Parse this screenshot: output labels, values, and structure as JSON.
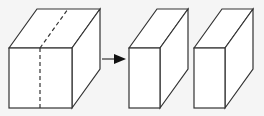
{
  "diagram": {
    "background": "#f5f5f5",
    "stroke_color": "#333333",
    "stroke_width": 1.2,
    "original_cube": {
      "front_face": {
        "x1": 9,
        "y1": 48,
        "x2": 72,
        "y2": 108
      },
      "back_offset": {
        "dx": 28,
        "dy": -39
      },
      "cut_line": {
        "front_x": 40,
        "style": "dashed"
      }
    },
    "arrow": {
      "x1": 102,
      "x2": 126,
      "y": 59,
      "direction": "right"
    },
    "result_blocks": [
      {
        "front_face": {
          "x1": 129,
          "y1": 48,
          "x2": 160,
          "y2": 108
        },
        "back_offset": {
          "dx": 28,
          "dy": -39
        }
      },
      {
        "front_face": {
          "x1": 194,
          "y1": 48,
          "x2": 225,
          "y2": 108
        },
        "back_offset": {
          "dx": 28,
          "dy": -39
        }
      }
    ]
  }
}
